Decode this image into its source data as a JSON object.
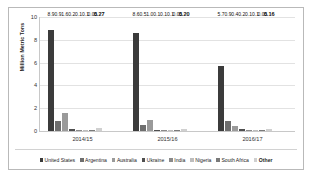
{
  "chart_data": {
    "type": "bar",
    "title": "",
    "subtitle": "",
    "xlabel": "",
    "ylabel": "Million Metric Tons",
    "ylim": [
      0,
      10
    ],
    "yticks": [
      0,
      2,
      4,
      6,
      8,
      10
    ],
    "grid": true,
    "legend_position": "bottom",
    "categories": [
      "2014/15",
      "2015/16",
      "2016/17"
    ],
    "series": [
      {
        "name": "United States",
        "color": "#3b3b3b",
        "values": [
          8.9,
          8.6,
          5.7
        ],
        "labels": [
          "8.9",
          "8.6",
          "5.7"
        ]
      },
      {
        "name": "Argentina",
        "color": "#6e6e6e",
        "values": [
          0.9,
          0.5,
          0.9
        ],
        "labels": [
          "0.9",
          "0.5",
          "0.9"
        ]
      },
      {
        "name": "Australia",
        "color": "#9a9a9a",
        "values": [
          1.6,
          1.0,
          0.4
        ],
        "labels": [
          "1.6",
          "1.0",
          "0.4"
        ]
      },
      {
        "name": "Ukraine",
        "color": "#4f4f4f",
        "values": [
          0.2,
          0.1,
          0.2
        ],
        "labels": [
          "0.2",
          "0.1",
          "0.2"
        ]
      },
      {
        "name": "India",
        "color": "#8a8a8a",
        "values": [
          0.1,
          0.1,
          0.1
        ],
        "labels": [
          "0.1",
          "0.1",
          "0.1"
        ]
      },
      {
        "name": "Nigeria",
        "color": "#bdbdbd",
        "values": [
          0.1,
          0.1,
          0.1
        ],
        "labels": [
          "0.1",
          "0.1",
          "0.1"
        ]
      },
      {
        "name": "South Africa",
        "color": "#7a7a7a",
        "values": [
          0.05,
          0.05,
          0.05
        ],
        "labels": [
          "0.05",
          "0.05",
          "0.05"
        ]
      },
      {
        "name": "Other",
        "color": "#d0d0d0",
        "values": [
          0.27,
          0.2,
          0.16
        ],
        "labels": [
          "0.27",
          "0.20",
          "0.16"
        ],
        "label_bold": true
      }
    ]
  },
  "axis": {
    "y_title": "Million Metric Tons"
  }
}
